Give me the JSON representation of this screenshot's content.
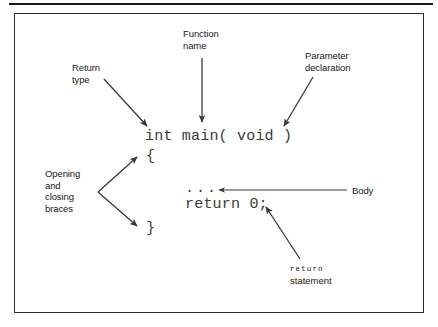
{
  "figure": {
    "type": "annotated-code-diagram",
    "border_color": "#2b2b2b",
    "background_color": "#ffffff",
    "text_color": "#1a1a1a",
    "code_color": "#3a3a3a"
  },
  "code": {
    "signature": "int main( void )",
    "open_brace": "{",
    "ellipsis": "...",
    "return_line": "return 0;",
    "close_brace": "}"
  },
  "callouts": {
    "return_type": "Return\ntype",
    "function_name": "Function\nname",
    "parameter_declaration": "Parameter\ndeclaration",
    "braces": "Opening\nand\nclosing\nbraces",
    "body": "Body",
    "return_statement_keyword": "return",
    "return_statement_word": "statement"
  },
  "arrows": [
    {
      "name": "return-type-arrow",
      "from": [
        104,
        79
      ],
      "to": [
        149,
        128
      ]
    },
    {
      "name": "function-name-arrow",
      "from": [
        202,
        58
      ],
      "to": [
        202,
        124
      ]
    },
    {
      "name": "parameter-declaration-arrow",
      "from": [
        313,
        77
      ],
      "to": [
        283,
        128
      ]
    },
    {
      "name": "opening-brace-arrow",
      "from": [
        98,
        192
      ],
      "to": [
        139,
        156
      ]
    },
    {
      "name": "closing-brace-arrow",
      "from": [
        98,
        192
      ],
      "to": [
        139,
        227
      ]
    },
    {
      "name": "body-arrow",
      "from": [
        345,
        190
      ],
      "to": [
        218,
        190
      ]
    },
    {
      "name": "return-statement-arrow",
      "from": [
        300,
        258
      ],
      "to": [
        265,
        206
      ]
    }
  ]
}
